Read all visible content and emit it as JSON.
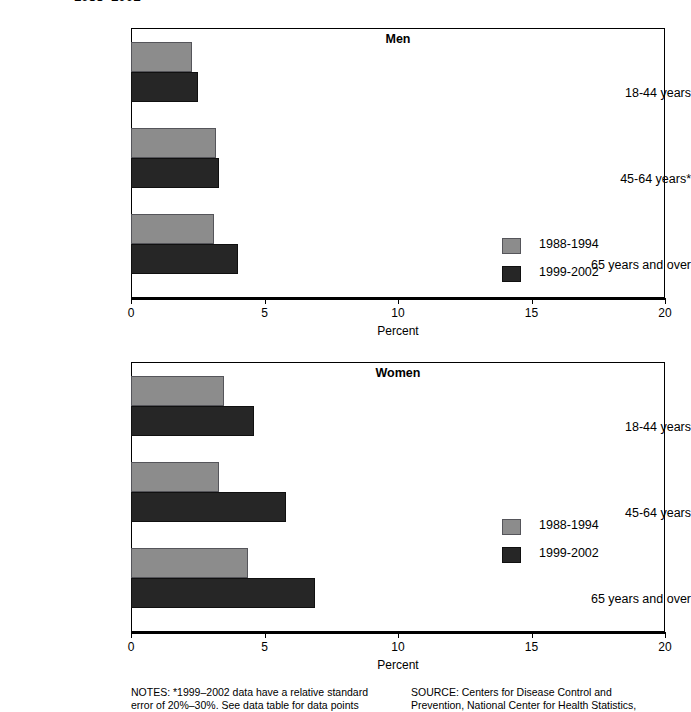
{
  "figure": {
    "title_cropped": "1988–2002",
    "footnotes": {
      "notes": "NOTES: *1999–2002 data have a relative standard\nerror of 20%–30%. See data table for data points",
      "source": "SOURCE: Centers for Disease Control and\nPrevention, National Center for Health Statistics,"
    }
  },
  "colors": {
    "series1": "#8c8c8c",
    "series2": "#262626",
    "axis": "#000000",
    "background": "#ffffff"
  },
  "legend": {
    "entries": [
      {
        "label": "1988-1994",
        "swatch": "series1"
      },
      {
        "label": "1999-2002",
        "swatch": "series2"
      }
    ]
  },
  "chart_data": [
    {
      "type": "bar",
      "orientation": "horizontal",
      "title": "Men",
      "categories": [
        "18-44 years",
        "45-64 years*",
        "65 years and over"
      ],
      "series": [
        {
          "name": "1988-1994",
          "values": [
            2.3,
            3.2,
            3.1
          ]
        },
        {
          "name": "1999-2002",
          "values": [
            2.5,
            3.3,
            4.0
          ]
        }
      ],
      "xlabel": "Percent",
      "ylabel": "",
      "xlim": [
        0,
        20
      ],
      "xticks": [
        0,
        5,
        10,
        15,
        20
      ],
      "grid": false,
      "legend_position": "middle-right"
    },
    {
      "type": "bar",
      "orientation": "horizontal",
      "title": "Women",
      "categories": [
        "18-44 years",
        "45-64 years",
        "65 years and over"
      ],
      "series": [
        {
          "name": "1988-1994",
          "values": [
            3.5,
            3.3,
            4.4
          ]
        },
        {
          "name": "1999-2002",
          "values": [
            4.6,
            5.8,
            6.9
          ]
        }
      ],
      "xlabel": "Percent",
      "ylabel": "",
      "xlim": [
        0,
        20
      ],
      "xticks": [
        0,
        5,
        10,
        15,
        20
      ],
      "grid": false,
      "legend_position": "middle-right"
    }
  ]
}
